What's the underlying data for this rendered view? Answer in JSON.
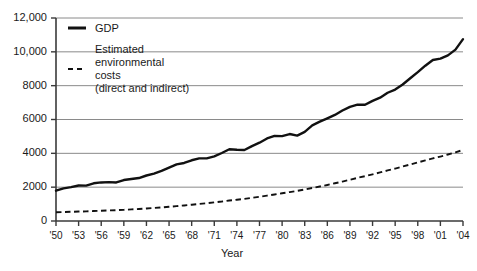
{
  "chart_data": {
    "type": "line",
    "title": "",
    "xlabel": "Year",
    "ylabel": "",
    "grid": true,
    "legend_position": "top-left",
    "xlim": [
      1950,
      2004
    ],
    "ylim": [
      0,
      12000
    ],
    "yticks": [
      0,
      2000,
      4000,
      6000,
      8000,
      10000,
      12000
    ],
    "ytick_labels": [
      "0",
      "2000",
      "4000",
      "6000",
      "8000",
      "10,000",
      "12,000"
    ],
    "xticks": [
      1950,
      1953,
      1956,
      1959,
      1962,
      1965,
      1968,
      1971,
      1974,
      1977,
      1980,
      1983,
      1986,
      1989,
      1992,
      1995,
      1998,
      2001,
      2004
    ],
    "xtick_labels": [
      "'50",
      "'53",
      "'56",
      "'59",
      "'62",
      "'65",
      "'68",
      "'71",
      "'74",
      "'77",
      "'80",
      "'83",
      "'86",
      "'89",
      "'92",
      "'95",
      "'98",
      "'01",
      "'04"
    ],
    "x": [
      1950,
      1951,
      1952,
      1953,
      1954,
      1955,
      1956,
      1957,
      1958,
      1959,
      1960,
      1961,
      1962,
      1963,
      1964,
      1965,
      1966,
      1967,
      1968,
      1969,
      1970,
      1971,
      1972,
      1973,
      1974,
      1975,
      1976,
      1977,
      1978,
      1979,
      1980,
      1981,
      1982,
      1983,
      1984,
      1985,
      1986,
      1987,
      1988,
      1989,
      1990,
      1991,
      1992,
      1993,
      1994,
      1995,
      1996,
      1997,
      1998,
      1999,
      2000,
      2001,
      2002,
      2003,
      2004
    ],
    "series": [
      {
        "name": "GDP",
        "style": "solid",
        "color": "#111111",
        "values": [
          1790,
          1930,
          2000,
          2100,
          2090,
          2230,
          2280,
          2300,
          2280,
          2420,
          2480,
          2540,
          2690,
          2800,
          2960,
          3150,
          3350,
          3430,
          3590,
          3700,
          3700,
          3820,
          4020,
          4240,
          4210,
          4200,
          4430,
          4630,
          4880,
          5030,
          5020,
          5140,
          5050,
          5270,
          5650,
          5870,
          6070,
          6270,
          6530,
          6750,
          6880,
          6870,
          7100,
          7290,
          7580,
          7770,
          8070,
          8440,
          8800,
          9180,
          9520,
          9600,
          9790,
          10130,
          10750
        ]
      },
      {
        "name": "Estimated environmental costs (direct and indirect)",
        "style": "dashed",
        "color": "#111111",
        "values": [
          520,
          530,
          545,
          560,
          570,
          590,
          610,
          625,
          640,
          660,
          685,
          710,
          740,
          770,
          800,
          840,
          880,
          920,
          965,
          1010,
          1050,
          1100,
          1150,
          1210,
          1260,
          1310,
          1370,
          1430,
          1500,
          1570,
          1640,
          1710,
          1780,
          1860,
          1950,
          2040,
          2130,
          2230,
          2330,
          2440,
          2550,
          2650,
          2760,
          2870,
          2990,
          3100,
          3220,
          3340,
          3460,
          3580,
          3700,
          3810,
          3930,
          4060,
          4200
        ]
      }
    ]
  },
  "legend": {
    "items": [
      {
        "label": "GDP",
        "style": "solid"
      },
      {
        "label_line1": "Estimated",
        "label_line2": "environmental",
        "label_line3": "costs",
        "label_line4": "(direct and indirect)",
        "style": "dashed"
      }
    ]
  },
  "axes": {
    "x_title": "Year"
  }
}
